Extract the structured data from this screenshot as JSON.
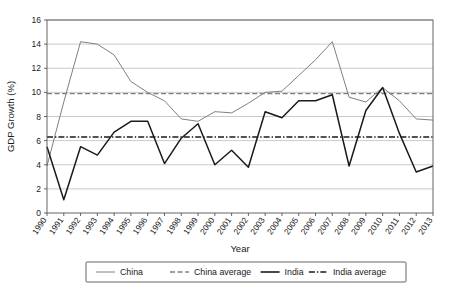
{
  "chart_data": {
    "type": "line",
    "title": "",
    "xlabel": "Year",
    "ylabel": "GDP Growth (%)",
    "xlim": [
      1990,
      2013
    ],
    "ylim": [
      0,
      16
    ],
    "ytick_step": 2,
    "yticks": [
      "0",
      "2",
      "4",
      "6",
      "8",
      "10",
      "12",
      "14",
      "16"
    ],
    "grid": "horizontal",
    "legend_position": "bottom-outside",
    "categories": [
      "1990",
      "1991",
      "1992",
      "1993",
      "1994",
      "1995",
      "1996",
      "1997",
      "1998",
      "1999",
      "2000",
      "2001",
      "2002",
      "2003",
      "2004",
      "2005",
      "2006",
      "2007",
      "2008",
      "2009",
      "2010",
      "2011",
      "2012",
      "2013"
    ],
    "series": [
      {
        "name": "China",
        "style": "solid",
        "color": "#808080",
        "values": [
          3.9,
          9.2,
          14.2,
          14.0,
          13.1,
          10.9,
          10.0,
          9.3,
          7.8,
          7.6,
          8.4,
          8.3,
          9.1,
          10.0,
          10.1,
          11.4,
          12.7,
          14.2,
          9.6,
          9.2,
          10.4,
          9.3,
          7.8,
          7.7
        ]
      },
      {
        "name": "China average",
        "style": "dashed",
        "color": "#808080",
        "constant": 9.9
      },
      {
        "name": "India",
        "style": "solid",
        "color": "#1a1a1a",
        "values": [
          5.5,
          1.1,
          5.5,
          4.8,
          6.7,
          7.6,
          7.6,
          4.1,
          6.2,
          7.4,
          4.0,
          5.2,
          3.8,
          8.4,
          7.9,
          9.3,
          9.3,
          9.8,
          3.9,
          8.5,
          10.4,
          6.6,
          3.4,
          3.9
        ]
      },
      {
        "name": "India average",
        "style": "dashdot",
        "color": "#1a1a1a",
        "constant": 6.3
      }
    ],
    "legend_entries": [
      {
        "label": "China",
        "style": "solid",
        "color": "#808080"
      },
      {
        "label": "China average",
        "style": "dashed",
        "color": "#808080"
      },
      {
        "label": "India",
        "style": "solid",
        "color": "#1a1a1a"
      },
      {
        "label": "India average",
        "style": "dashdot",
        "color": "#1a1a1a"
      }
    ]
  }
}
